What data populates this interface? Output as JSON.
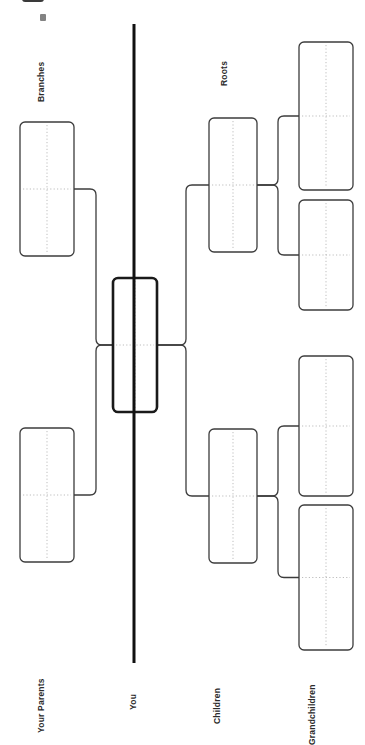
{
  "page": {
    "orientation": "rotated-90",
    "background_color": "#ffffff",
    "line_color": "#3c3c3c",
    "emphasis_color": "#1a1a1a",
    "guide_color": "#bdbdbd"
  },
  "divider": {
    "name": "center-divider",
    "color": "#111111",
    "x": 134,
    "y_start": 24,
    "y_end": 663,
    "thickness": 3
  },
  "labels": [
    {
      "id": "branches",
      "text": "Branches",
      "x": 46,
      "y": 92
    },
    {
      "id": "roots",
      "text": "Roots",
      "x": 229,
      "y": 76
    },
    {
      "id": "your_parents",
      "text": "Your Parents",
      "x": 46,
      "y": 723
    },
    {
      "id": "you",
      "text": "You",
      "x": 138,
      "y": 700
    },
    {
      "id": "children",
      "text": "Children",
      "x": 222,
      "y": 714
    },
    {
      "id": "grandchildren",
      "text": "Grandchildren",
      "x": 317,
      "y": 735
    }
  ],
  "boxes": [
    {
      "id": "parent-1",
      "group": "your-parents",
      "x": 20,
      "y": 122,
      "w": 54,
      "h": 134,
      "bold": false
    },
    {
      "id": "parent-2",
      "group": "your-parents",
      "x": 20,
      "y": 428,
      "w": 54,
      "h": 134,
      "bold": false
    },
    {
      "id": "you",
      "group": "you",
      "x": 113,
      "y": 278,
      "w": 44,
      "h": 134,
      "bold": true
    },
    {
      "id": "child-1",
      "group": "children",
      "x": 209,
      "y": 118,
      "w": 48,
      "h": 134,
      "bold": false
    },
    {
      "id": "child-2",
      "group": "children",
      "x": 209,
      "y": 429,
      "w": 48,
      "h": 134,
      "bold": false
    },
    {
      "id": "grandchild-1",
      "group": "grandchildren",
      "x": 299,
      "y": 42,
      "w": 54,
      "h": 148,
      "bold": false
    },
    {
      "id": "grandchild-2",
      "group": "grandchildren",
      "x": 299,
      "y": 200,
      "w": 54,
      "h": 110,
      "bold": false
    },
    {
      "id": "grandchild-3",
      "group": "grandchildren",
      "x": 299,
      "y": 356,
      "w": 54,
      "h": 140,
      "bold": false
    },
    {
      "id": "grandchild-4",
      "group": "grandchildren",
      "x": 299,
      "y": 505,
      "w": 54,
      "h": 145,
      "bold": false
    }
  ],
  "connectors": [
    {
      "id": "you-to-parents",
      "from": "you",
      "to": "your-parents"
    },
    {
      "id": "you-to-children",
      "from": "you",
      "to": "children"
    },
    {
      "id": "child1-to-grandkids",
      "from": "child-1",
      "to": "grandchildren"
    },
    {
      "id": "child2-to-grandkids",
      "from": "child-2",
      "to": "grandchildren"
    }
  ]
}
